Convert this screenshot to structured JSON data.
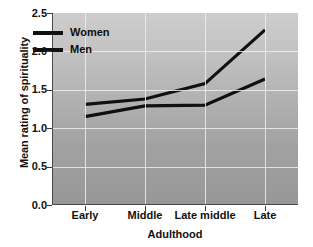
{
  "chart_data": {
    "type": "line",
    "title": "",
    "xlabel": "Adulthood",
    "ylabel": "Mean rating of spirituality",
    "categories": [
      "Early",
      "Middle",
      "Late middle",
      "Late"
    ],
    "series": [
      {
        "name": "Women",
        "values": [
          1.31,
          1.38,
          1.58,
          2.28
        ]
      },
      {
        "name": "Men",
        "values": [
          1.15,
          1.29,
          1.3,
          1.64
        ]
      }
    ],
    "ylim": [
      0.0,
      2.5
    ],
    "yticks": [
      "0.0",
      "0.5",
      "1.0",
      "1.5",
      "2.0",
      "2.5"
    ],
    "ytick_values": [
      0.0,
      0.5,
      1.0,
      1.5,
      2.0,
      2.5
    ],
    "grid": "both",
    "legend_position": "upper-left-inside",
    "line_color": "#101010",
    "plot_background": "gray-vertical-gradient"
  },
  "legend": {
    "items": [
      {
        "label": "Women"
      },
      {
        "label": "Men"
      }
    ]
  }
}
